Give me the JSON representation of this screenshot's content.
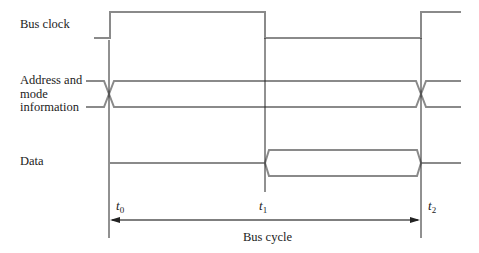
{
  "diagram": {
    "type": "timing-diagram",
    "signals": [
      {
        "name": "bus-clock",
        "label": "Bus clock"
      },
      {
        "name": "address-mode",
        "label_lines": [
          "Address and",
          "mode",
          "information"
        ]
      },
      {
        "name": "data",
        "label": "Data"
      }
    ],
    "time_markers": [
      {
        "symbol": "t",
        "subscript": "0"
      },
      {
        "symbol": "t",
        "subscript": "1"
      },
      {
        "symbol": "t",
        "subscript": "2"
      }
    ],
    "span": {
      "label": "Bus cycle",
      "from": "t0",
      "to": "t2"
    },
    "colors": {
      "signal": "#8a8a8a",
      "marker": "#222222",
      "text": "#222222"
    }
  }
}
